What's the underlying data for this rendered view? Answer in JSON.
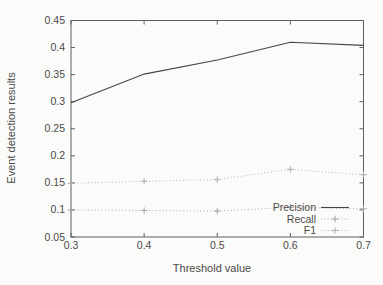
{
  "figure": {
    "background_color": "#fbfbf9",
    "border_color": "#5f5f5f",
    "text_color": "#4a4a4a"
  },
  "chart_data": {
    "type": "line",
    "title": "",
    "xlabel": "Threshold value",
    "ylabel": "Event detection results",
    "xlim": [
      0.3,
      0.7
    ],
    "ylim": [
      0.05,
      0.45
    ],
    "x": [
      0.3,
      0.4,
      0.5,
      0.6,
      0.7
    ],
    "x_ticks": [
      "0.3",
      "0.4",
      "0.5",
      "0.6",
      "0.7"
    ],
    "y_ticks": [
      "0.05",
      "0.1",
      "0.15",
      "0.2",
      "0.25",
      "0.3",
      "0.35",
      "0.4",
      "0.45"
    ],
    "grid": false,
    "legend_position": "inside-bottom-right",
    "series": [
      {
        "name": "Precision",
        "values": [
          0.298,
          0.351,
          0.377,
          0.41,
          0.404
        ],
        "style": "solid",
        "marker": "none",
        "color": "#454545"
      },
      {
        "name": "Recall",
        "values": [
          0.1,
          0.099,
          0.098,
          0.105,
          0.102
        ],
        "style": "dotted",
        "marker": "plus",
        "color": "#a3a3a3"
      },
      {
        "name": "F1",
        "values": [
          0.149,
          0.153,
          0.156,
          0.175,
          0.165
        ],
        "style": "dotted",
        "marker": "plus",
        "color": "#adadad"
      }
    ]
  }
}
